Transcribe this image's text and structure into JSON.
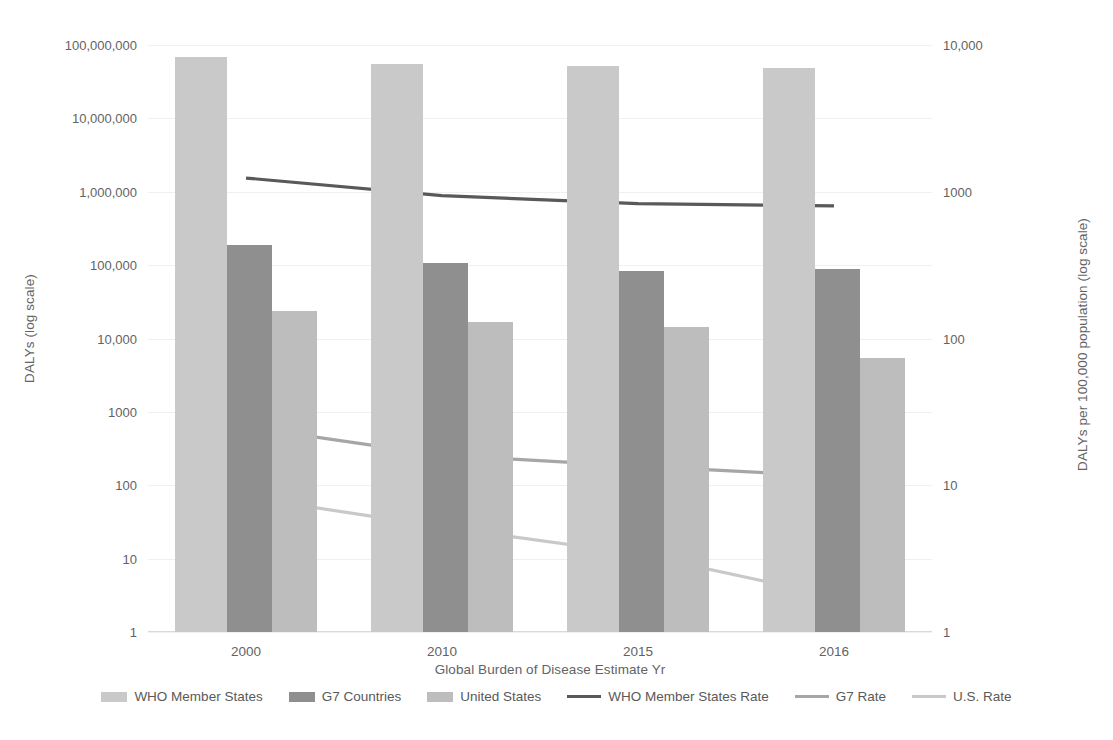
{
  "chart_data": {
    "type": "bar",
    "title": "",
    "xlabel": "Global Burden of Disease Estimate Yr",
    "ylabel": "DALYs (log scale)",
    "y2label": "DALYs per 100,000 population (log scale)",
    "categories": [
      "2000",
      "2010",
      "2015",
      "2016"
    ],
    "ylim": [
      1,
      100000000
    ],
    "y2lim": [
      1,
      10000
    ],
    "yticks": [
      "1",
      "10",
      "100",
      "1000",
      "10,000",
      "100,000",
      "1,000,000",
      "10,000,000",
      "100,000,000"
    ],
    "ytick_values": [
      1,
      10,
      100,
      1000,
      10000,
      100000,
      1000000,
      10000000,
      100000000
    ],
    "y2ticks": [
      "1",
      "10",
      "100",
      "1000",
      "10,000"
    ],
    "y2tick_values": [
      1,
      10,
      100,
      1000,
      10000
    ],
    "grid": true,
    "legend_position": "bottom",
    "bar_series": [
      {
        "name": "WHO Member States",
        "axis": "left",
        "color": "#c9c9c9",
        "values": [
          68000000,
          55000000,
          51000000,
          49000000
        ]
      },
      {
        "name": "G7 Countries",
        "axis": "left",
        "color": "#8f8f8f",
        "values": [
          190000,
          107000,
          84000,
          88000
        ]
      },
      {
        "name": "United States",
        "axis": "left",
        "color": "#bdbdbd",
        "values": [
          24000,
          17000,
          14500,
          5400
        ]
      }
    ],
    "line_series": [
      {
        "name": "WHO Member States Rate",
        "axis": "right",
        "color": "#595959",
        "values": [
          1240,
          940,
          830,
          800
        ]
      },
      {
        "name": "G7 Rate",
        "axis": "right",
        "color": "#a6a6a6",
        "values": [
          25,
          16,
          13.5,
          11.5
        ]
      },
      {
        "name": "U.S. Rate",
        "axis": "right",
        "color": "#c9c9c9",
        "values": [
          8.3,
          5.2,
          3.4,
          1.75
        ]
      }
    ]
  },
  "axes": {
    "y_left_title": "DALYs (log scale)",
    "y_right_title": "DALYs per 100,000 population (log scale)",
    "x_title": "Global Burden of Disease Estimate Yr"
  },
  "legend": {
    "items": [
      {
        "label": "WHO Member States",
        "kind": "bar",
        "color": "#c9c9c9"
      },
      {
        "label": "G7 Countries",
        "kind": "bar",
        "color": "#8f8f8f"
      },
      {
        "label": "United States",
        "kind": "bar",
        "color": "#bdbdbd"
      },
      {
        "label": "WHO Member States Rate",
        "kind": "line",
        "color": "#595959"
      },
      {
        "label": "G7 Rate",
        "kind": "line",
        "color": "#a6a6a6"
      },
      {
        "label": "U.S. Rate",
        "kind": "line",
        "color": "#c9c9c9"
      }
    ]
  },
  "caption": ""
}
